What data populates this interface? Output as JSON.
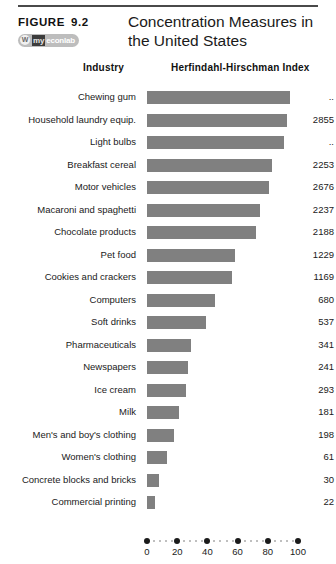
{
  "header": {
    "figure_label": "FIGURE",
    "figure_number": "9.2",
    "title": "Concentration Measures in the United States",
    "logo": {
      "mark": "W",
      "prefix": "my",
      "suffix": "econlab"
    }
  },
  "columns": {
    "industry": "Industry",
    "index": "Herfindahl-Hirschman Index"
  },
  "chart_data": {
    "type": "bar",
    "orientation": "horizontal",
    "title": "Concentration Measures in the United States",
    "xlabel": "Herfindahl-Hirschman Index",
    "ylabel": "Industry",
    "xlim": [
      0,
      100
    ],
    "xticks": [
      0,
      20,
      40,
      60,
      80,
      100
    ],
    "grid": false,
    "legend": false,
    "bar_color": "#808080",
    "note": "Bar length shows the four-firm concentration ratio (percent); the numeric column shows the Herfindahl-Hirschman Index. '..' means not available.",
    "categories": [
      "Chewing gum",
      "Household laundry equip.",
      "Light bulbs",
      "Breakfast cereal",
      "Motor vehicles",
      "Macaroni and spaghetti",
      "Chocolate products",
      "Pet food",
      "Cookies and crackers",
      "Computers",
      "Soft drinks",
      "Pharmaceuticals",
      "Newspapers",
      "Ice cream",
      "Milk",
      "Men's and boy's clothing",
      "Women's clothing",
      "Concrete blocks and bricks",
      "Commercial printing"
    ],
    "values": [
      95,
      93,
      91,
      83,
      81,
      75,
      72,
      58,
      56,
      45,
      39,
      29,
      27,
      26,
      21,
      18,
      13,
      8,
      5
    ],
    "index_labels": [
      "..",
      "2855",
      "..",
      "2253",
      "2676",
      "2237",
      "2188",
      "1229",
      "1169",
      "680",
      "537",
      "341",
      "241",
      "293",
      "181",
      "198",
      "61",
      "30",
      "22"
    ]
  },
  "axis": {
    "minor_tick_step": 4,
    "tick_labels": [
      "0",
      "20",
      "40",
      "60",
      "80",
      "100"
    ]
  }
}
